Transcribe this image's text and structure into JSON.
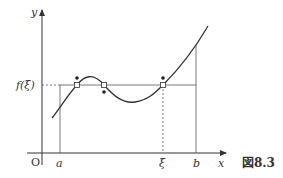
{
  "figure": {
    "caption": "図8.3",
    "axis_labels": {
      "x": "x",
      "y": "y",
      "origin": "O"
    },
    "x_ticks": [
      "a",
      "ξ",
      "b"
    ],
    "y_ticks": [
      "f(ξ)"
    ]
  },
  "colors": {
    "stroke": "#333333",
    "guide": "#555555"
  }
}
